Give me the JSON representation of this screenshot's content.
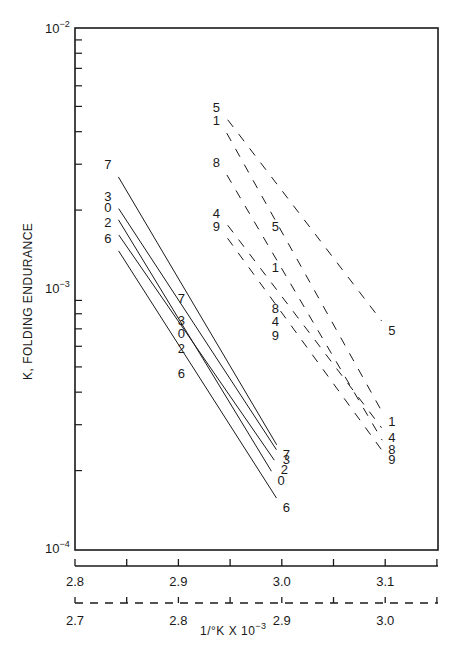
{
  "chart_data": {
    "type": "line",
    "title": "",
    "ylabel": "K, FOLDING ENDURANCE",
    "xlabel": "1/°K X 10⁻³",
    "yscale": "log",
    "ylim": [
      0.0001,
      0.01
    ],
    "y_ticks": [
      {
        "label": "10⁻²",
        "value": 0.01
      },
      {
        "label": "10⁻³",
        "value": 0.001
      },
      {
        "label": "10⁻⁴",
        "value": 0.0001
      }
    ],
    "x_axis_solid": {
      "style": "solid",
      "range": [
        2.8,
        3.15
      ],
      "tick_labels": [
        "2.8",
        "2.9",
        "3.0",
        "3.1"
      ]
    },
    "x_axis_dashed": {
      "style": "dashed",
      "range": [
        2.7,
        3.05
      ],
      "tick_labels": [
        "2.7",
        "2.8",
        "2.9",
        "3.0"
      ]
    },
    "grid": false,
    "legend": "none (series labeled inline by digit at line endpoints)",
    "series": [
      {
        "name": "7",
        "style": "solid",
        "x_axis": "solid",
        "x": [
          2.838,
          2.909,
          2.998
        ],
        "y": [
          0.00285,
          0.00087,
          0.00024
        ]
      },
      {
        "name": "3",
        "style": "solid",
        "x_axis": "solid",
        "x": [
          2.838,
          2.909,
          2.998
        ],
        "y": [
          0.00215,
          0.00072,
          0.00023
        ]
      },
      {
        "name": "0",
        "style": "solid",
        "x_axis": "solid",
        "x": [
          2.838,
          2.909,
          2.993
        ],
        "y": [
          0.00195,
          0.00064,
          0.00019
        ]
      },
      {
        "name": "2",
        "style": "solid",
        "x_axis": "solid",
        "x": [
          2.838,
          2.909,
          2.996
        ],
        "y": [
          0.0017,
          0.00056,
          0.00021
        ]
      },
      {
        "name": "6",
        "style": "solid",
        "x_axis": "solid",
        "x": [
          2.838,
          2.909,
          2.998
        ],
        "y": [
          0.00148,
          0.00045,
          0.00015
        ]
      },
      {
        "name": "5",
        "style": "dashed",
        "x_axis": "dashed",
        "x": [
          2.843,
          2.9,
          3.0
        ],
        "y": [
          0.0047,
          0.00165,
          0.00072
        ]
      },
      {
        "name": "1",
        "style": "dashed",
        "x_axis": "dashed",
        "x": [
          2.843,
          2.9,
          3.0
        ],
        "y": [
          0.0042,
          0.00115,
          0.00032
        ]
      },
      {
        "name": "8",
        "style": "dashed",
        "x_axis": "dashed",
        "x": [
          2.843,
          2.9,
          3.0
        ],
        "y": [
          0.0029,
          0.0008,
          0.00025
        ]
      },
      {
        "name": "4",
        "style": "dashed",
        "x_axis": "dashed",
        "x": [
          2.843,
          2.9,
          3.0
        ],
        "y": [
          0.00185,
          0.00071,
          0.00028
        ]
      },
      {
        "name": "9",
        "style": "dashed",
        "x_axis": "dashed",
        "x": [
          2.843,
          2.9,
          3.0
        ],
        "y": [
          0.00165,
          0.00063,
          0.00023
        ]
      }
    ]
  },
  "labels": {
    "y_axis_title": "K, FOLDING ENDURANCE",
    "x_axis_title": "1/°K X 10",
    "x_axis_title_exp": "−3",
    "y_tick_top": "10",
    "y_tick_top_exp": "−2",
    "y_tick_mid": "10",
    "y_tick_mid_exp": "−3",
    "y_tick_bot": "10",
    "y_tick_bot_exp": "−4"
  }
}
